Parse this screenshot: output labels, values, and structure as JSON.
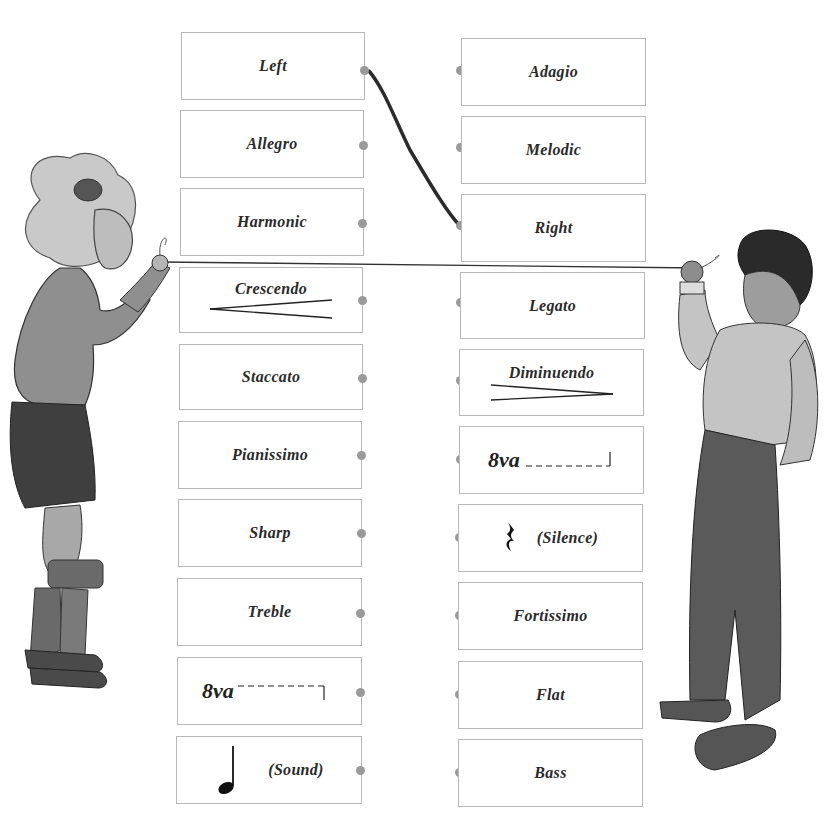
{
  "worksheet": {
    "type": "matching-exercise",
    "instruction_visual": "Connect each term on the left to its opposite on the right",
    "left_column": [
      {
        "label": "Left"
      },
      {
        "label": "Allegro"
      },
      {
        "label": "Harmonic"
      },
      {
        "label": "Crescendo",
        "symbol": "crescendo-hairpin"
      },
      {
        "label": "Staccato"
      },
      {
        "label": "Pianissimo"
      },
      {
        "label": "Sharp"
      },
      {
        "label": "Treble"
      },
      {
        "label": "8va",
        "symbol": "8va-bracket-up"
      },
      {
        "label": "(Sound)",
        "symbol": "quarter-note"
      }
    ],
    "right_column": [
      {
        "label": "Adagio"
      },
      {
        "label": "Melodic"
      },
      {
        "label": "Right"
      },
      {
        "label": "Legato"
      },
      {
        "label": "Diminuendo",
        "symbol": "diminuendo-hairpin"
      },
      {
        "label": "8va",
        "symbol": "8va-bracket-down"
      },
      {
        "label": "(Silence)",
        "symbol": "quarter-rest"
      },
      {
        "label": "Fortissimo"
      },
      {
        "label": "Flat"
      },
      {
        "label": "Bass"
      }
    ],
    "connections_drawn": [
      {
        "from": "Left",
        "to": "Right"
      }
    ],
    "illustrations": [
      {
        "name": "girl",
        "position": "left",
        "holding": "string"
      },
      {
        "name": "boy",
        "position": "right",
        "holding": "string"
      }
    ],
    "colors": {
      "card_border": "#b8b8b8",
      "dot": "#9a9a9a",
      "connector": "#2b2b2b",
      "text": "#2a2a2a"
    }
  }
}
